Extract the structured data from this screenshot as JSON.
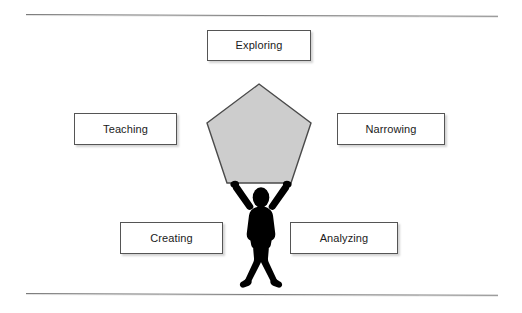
{
  "diagram": {
    "background_color": "#ffffff",
    "rule_color": "#7b7b7b",
    "rules": [
      {
        "name": "top-rule"
      },
      {
        "name": "bottom-rule"
      }
    ],
    "center_shape": {
      "name": "pentagon",
      "sides": 5,
      "fill_color": "#cdcdcd",
      "stroke_color": "#4a4a4a",
      "label": ""
    },
    "figure": {
      "name": "stick-figure",
      "pose": "arms raised holding pentagon overhead",
      "fill_color": "#000000"
    },
    "boxes": [
      {
        "id": "exploring",
        "label": "Exploring",
        "position": "top-center",
        "border_color": "#555555",
        "fill_color": "#ffffff",
        "text_color": "#1b1b1b"
      },
      {
        "id": "teaching",
        "label": "Teaching",
        "position": "middle-left",
        "border_color": "#555555",
        "fill_color": "#ffffff",
        "text_color": "#1b1b1b"
      },
      {
        "id": "narrowing",
        "label": "Narrowing",
        "position": "middle-right",
        "border_color": "#555555",
        "fill_color": "#ffffff",
        "text_color": "#1b1b1b"
      },
      {
        "id": "creating",
        "label": "Creating",
        "position": "bottom-left",
        "border_color": "#555555",
        "fill_color": "#ffffff",
        "text_color": "#1b1b1b"
      },
      {
        "id": "analyzing",
        "label": "Analyzing",
        "position": "bottom-right",
        "border_color": "#555555",
        "fill_color": "#ffffff",
        "text_color": "#1b1b1b"
      }
    ]
  }
}
